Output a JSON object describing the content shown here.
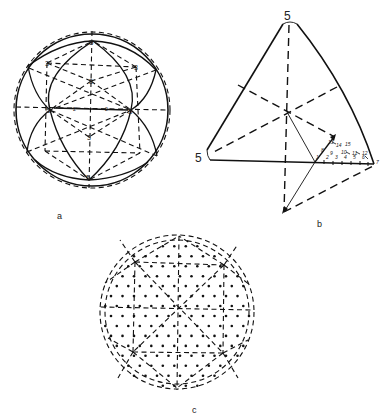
{
  "figure": {
    "panels": [
      {
        "id": "a",
        "caption": "a",
        "description": "Sphere with icosahedral symmetry: solid great-circle arcs and dashed lines; 5-fold and 3-fold axes labeled",
        "vertex_labels": {
          "fivefold": "5",
          "threefold": "3",
          "twofold": "2"
        },
        "labels": [
          {
            "text": "5",
            "x": 92,
            "y": 44
          },
          {
            "text": "5",
            "x": 50,
            "y": 111
          },
          {
            "text": "5",
            "x": 131,
            "y": 111
          },
          {
            "text": "5",
            "x": 89,
            "y": 177
          },
          {
            "text": "3",
            "x": 47,
            "y": 63
          },
          {
            "text": "3",
            "x": 136,
            "y": 67
          },
          {
            "text": "3",
            "x": 91,
            "y": 81
          },
          {
            "text": "3",
            "x": 89,
            "y": 137
          },
          {
            "text": "2",
            "x": 75,
            "y": 109
          },
          {
            "text": "2",
            "x": 107,
            "y": 109
          }
        ]
      },
      {
        "id": "b",
        "caption": "b",
        "description": "Spherical triangle between three 5-fold axes with projected asymmetric unit and numbered lattice points",
        "corner_labels": {
          "top": "5",
          "left": "5"
        },
        "baseline_numbers": [
          "1",
          "2",
          "3",
          "4",
          "5",
          "6",
          "7"
        ],
        "diagonal_numbers": [
          "8",
          "9",
          "13",
          "14",
          "15"
        ],
        "inner_numbers": [
          "10",
          "11",
          "12"
        ]
      },
      {
        "id": "c",
        "caption": "c",
        "description": "Sphere with dashed icosahedral triangulation and evenly distributed dots (lattice points)"
      }
    ]
  }
}
